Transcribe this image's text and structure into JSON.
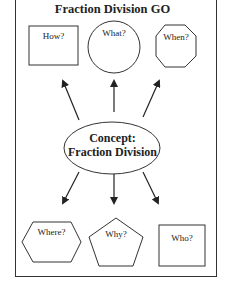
{
  "title": "Fraction Division GO",
  "center": {
    "line1": "Concept:",
    "line2": "Fraction Division"
  },
  "nodes": [
    {
      "id": "how",
      "label": "How?",
      "shape": "square"
    },
    {
      "id": "what",
      "label": "What?",
      "shape": "circle"
    },
    {
      "id": "when",
      "label": "When?",
      "shape": "octagon"
    },
    {
      "id": "where",
      "label": "Where?",
      "shape": "hexagon"
    },
    {
      "id": "why",
      "label": "Why?",
      "shape": "pentagon"
    },
    {
      "id": "who",
      "label": "Who?",
      "shape": "square"
    }
  ]
}
